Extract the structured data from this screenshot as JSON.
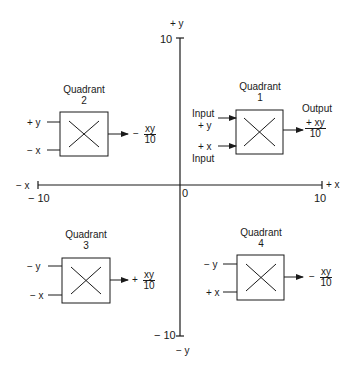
{
  "axes": {
    "y_pos_label": "+ y",
    "y_neg_label": "− y",
    "x_pos_label": "+ x",
    "x_neg_label": "− x",
    "y_max_tick": "10",
    "y_min_tick": "− 10",
    "x_max_tick": "10",
    "x_min_tick": "− 10",
    "origin": "0"
  },
  "quadrants": [
    {
      "title": "Quadrant",
      "number": "1",
      "input_top": "+ y",
      "input_top_caption": "Input",
      "input_bottom": "+ x",
      "input_bottom_caption": "Input",
      "output_caption": "Output",
      "output_sign": "+",
      "output_num": "+ xy",
      "output_den": "10",
      "icon": "multiplier-x-icon"
    },
    {
      "title": "Quadrant",
      "number": "2",
      "input_top": "+ y",
      "input_bottom": "− x",
      "output_sign": "−",
      "output_num": "xy",
      "output_den": "10",
      "icon": "multiplier-x-icon"
    },
    {
      "title": "Quadrant",
      "number": "3",
      "input_top": "− y",
      "input_bottom": "− x",
      "output_sign": "+",
      "output_num": "xy",
      "output_den": "10",
      "icon": "multiplier-x-icon"
    },
    {
      "title": "Quadrant",
      "number": "4",
      "input_top": "− y",
      "input_bottom": "+ x",
      "output_sign": "−",
      "output_num": "xy",
      "output_den": "10",
      "icon": "multiplier-x-icon"
    }
  ],
  "colors": {
    "ink": "#1a1a1a",
    "background": "#ffffff"
  }
}
